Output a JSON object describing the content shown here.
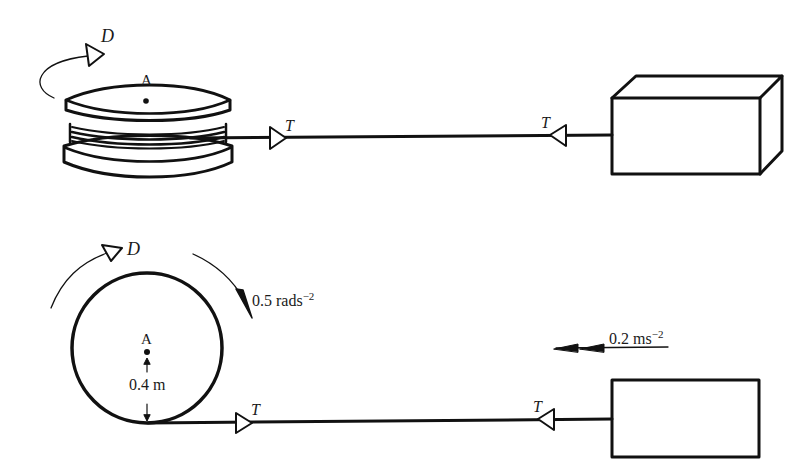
{
  "top_view": {
    "drive_label": "D",
    "center_label": "A",
    "tension_left_label": "T",
    "tension_right_label": "T"
  },
  "side_view": {
    "drive_label": "D",
    "center_label": "A",
    "angular_accel_value": "0.5 rads",
    "angular_accel_exp": "−2",
    "radius_label": "0.4 m",
    "tension_left_label": "T",
    "tension_right_label": "T",
    "linear_accel_value": "0.2 ms",
    "linear_accel_exp": "−2"
  },
  "colors": {
    "stroke": "#111111",
    "background": "#ffffff"
  }
}
